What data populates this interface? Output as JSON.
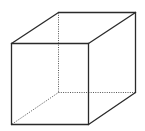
{
  "diagram": {
    "type": "wireframe-cube",
    "colors": {
      "edge": "#2a2a2a",
      "hidden_edge": "#555555",
      "background": "#ffffff"
    },
    "vertices": {
      "front_top_left": [
        11,
        43
      ],
      "front_top_right": [
        88,
        43
      ],
      "front_bottom_right": [
        88,
        124
      ],
      "front_bottom_left": [
        11,
        124
      ],
      "back_top_left": [
        58,
        12
      ],
      "back_top_right": [
        135,
        12
      ],
      "back_bottom_right": [
        135,
        92
      ],
      "back_bottom_left": [
        58,
        92
      ]
    },
    "visible_edges": [
      [
        "front_top_left",
        "front_top_right"
      ],
      [
        "front_top_right",
        "front_bottom_right"
      ],
      [
        "front_bottom_right",
        "front_bottom_left"
      ],
      [
        "front_bottom_left",
        "front_top_left"
      ],
      [
        "front_top_left",
        "back_top_left"
      ],
      [
        "back_top_left",
        "back_top_right"
      ],
      [
        "back_top_right",
        "front_top_right"
      ],
      [
        "back_top_right",
        "back_bottom_right"
      ],
      [
        "back_bottom_right",
        "front_bottom_right"
      ]
    ],
    "hidden_edges": [
      [
        "back_top_left",
        "back_bottom_left"
      ],
      [
        "back_bottom_left",
        "back_bottom_right"
      ],
      [
        "back_bottom_left",
        "front_bottom_left"
      ]
    ]
  }
}
